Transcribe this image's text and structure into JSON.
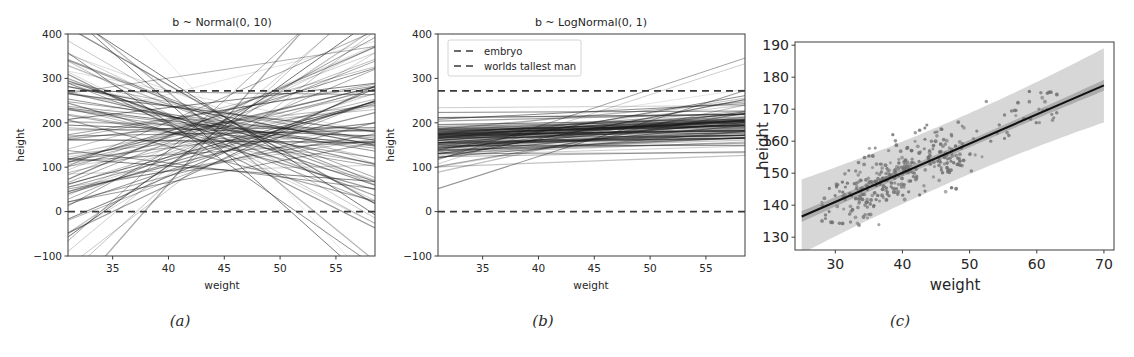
{
  "figure": {
    "panel_captions": [
      "(a)",
      "(b)",
      "(c)"
    ]
  },
  "chart_data": [
    {
      "panel": "(a)",
      "type": "line",
      "title": "b ~ Normal(0, 10)",
      "xlabel": "weight",
      "ylabel": "height",
      "xlim": [
        31,
        58.5
      ],
      "ylim": [
        -100,
        400
      ],
      "xticks": [
        35,
        40,
        45,
        50,
        55
      ],
      "yticks": [
        -100,
        0,
        100,
        200,
        300,
        400
      ],
      "grid": false,
      "legend": null,
      "description": "100 prior regression lines for height vs weight with b ~ Normal(0, 10); lines fan out in both directions, pivoting near mean weight 45 at height about 178.",
      "annotations": [
        {
          "label": "embryo",
          "type": "hline",
          "y": 0,
          "style": "dashed"
        },
        {
          "label": "worlds tallest man",
          "type": "hline",
          "y": 272,
          "style": "dashed"
        }
      ],
      "series_summary": {
        "n_lines": 100,
        "pivot_x": 45,
        "intercept_mean_at_pivot": 178,
        "slope_distribution": "Normal(0, 10)",
        "slope_examples": [
          -14.2,
          -11.8,
          -9.6,
          -8.1,
          -6.9,
          -5.4,
          -4.2,
          -3.1,
          -2.0,
          -1.1,
          -0.3,
          0.5,
          1.4,
          2.3,
          3.4,
          4.6,
          5.8,
          7.2,
          8.9,
          11.0,
          13.5,
          16.0
        ]
      }
    },
    {
      "panel": "(b)",
      "type": "line",
      "title": "b ~ LogNormal(0, 1)",
      "xlabel": "weight",
      "ylabel": "height",
      "xlim": [
        31,
        58.5
      ],
      "ylim": [
        -100,
        400
      ],
      "xticks": [
        35,
        40,
        45,
        50,
        55
      ],
      "yticks": [
        -100,
        0,
        100,
        200,
        300,
        400
      ],
      "grid": false,
      "legend": {
        "position": "upper left",
        "entries": [
          "embryo",
          "worlds tallest man"
        ]
      },
      "description": "100 prior regression lines for height vs weight with b ~ LogNormal(0, 1); all slopes positive so every line rises, most staying between 100 and 250 cm.",
      "annotations": [
        {
          "label": "embryo",
          "type": "hline",
          "y": 0,
          "style": "dashed"
        },
        {
          "label": "worlds tallest man",
          "type": "hline",
          "y": 272,
          "style": "dashed"
        }
      ],
      "series_summary": {
        "n_lines": 100,
        "pivot_x": 45,
        "intercept_mean_at_pivot": 178,
        "slope_distribution": "LogNormal(0, 1)",
        "slope_examples": [
          0.09,
          0.14,
          0.2,
          0.27,
          0.34,
          0.42,
          0.5,
          0.58,
          0.67,
          0.77,
          0.88,
          1.0,
          1.13,
          1.28,
          1.45,
          1.65,
          1.9,
          2.2,
          2.6,
          3.2,
          4.1,
          5.6
        ]
      }
    },
    {
      "panel": "(c)",
      "type": "scatter",
      "title": "",
      "xlabel": "weight",
      "ylabel": "height",
      "xlim": [
        24,
        71.5
      ],
      "ylim": [
        126,
        191
      ],
      "xticks": [
        30,
        40,
        50,
        60,
        70
      ],
      "yticks": [
        130,
        140,
        150,
        160,
        170,
        180,
        190
      ],
      "grid": false,
      "legend": null,
      "description": "Posterior fit of height on weight: grey observed data points, black mean regression line, narrow dark compatibility interval for the mean and wide light grey prediction interval.",
      "regression_line": {
        "x": [
          25,
          70
        ],
        "y": [
          136.5,
          177.5
        ],
        "slope": 0.911,
        "intercept": 113.7,
        "color": "#111111"
      },
      "bands": [
        {
          "name": "mean-hpdi",
          "color": "#8a8a8a",
          "alpha": 0.55,
          "half_width": 1.1
        },
        {
          "name": "prediction-interval",
          "color": "#c9c9c9",
          "alpha": 0.75,
          "half_width": 9.5
        }
      ],
      "n_points": 352,
      "points_x_range": [
        28,
        63
      ],
      "points_y_range": [
        133,
        179
      ]
    }
  ]
}
